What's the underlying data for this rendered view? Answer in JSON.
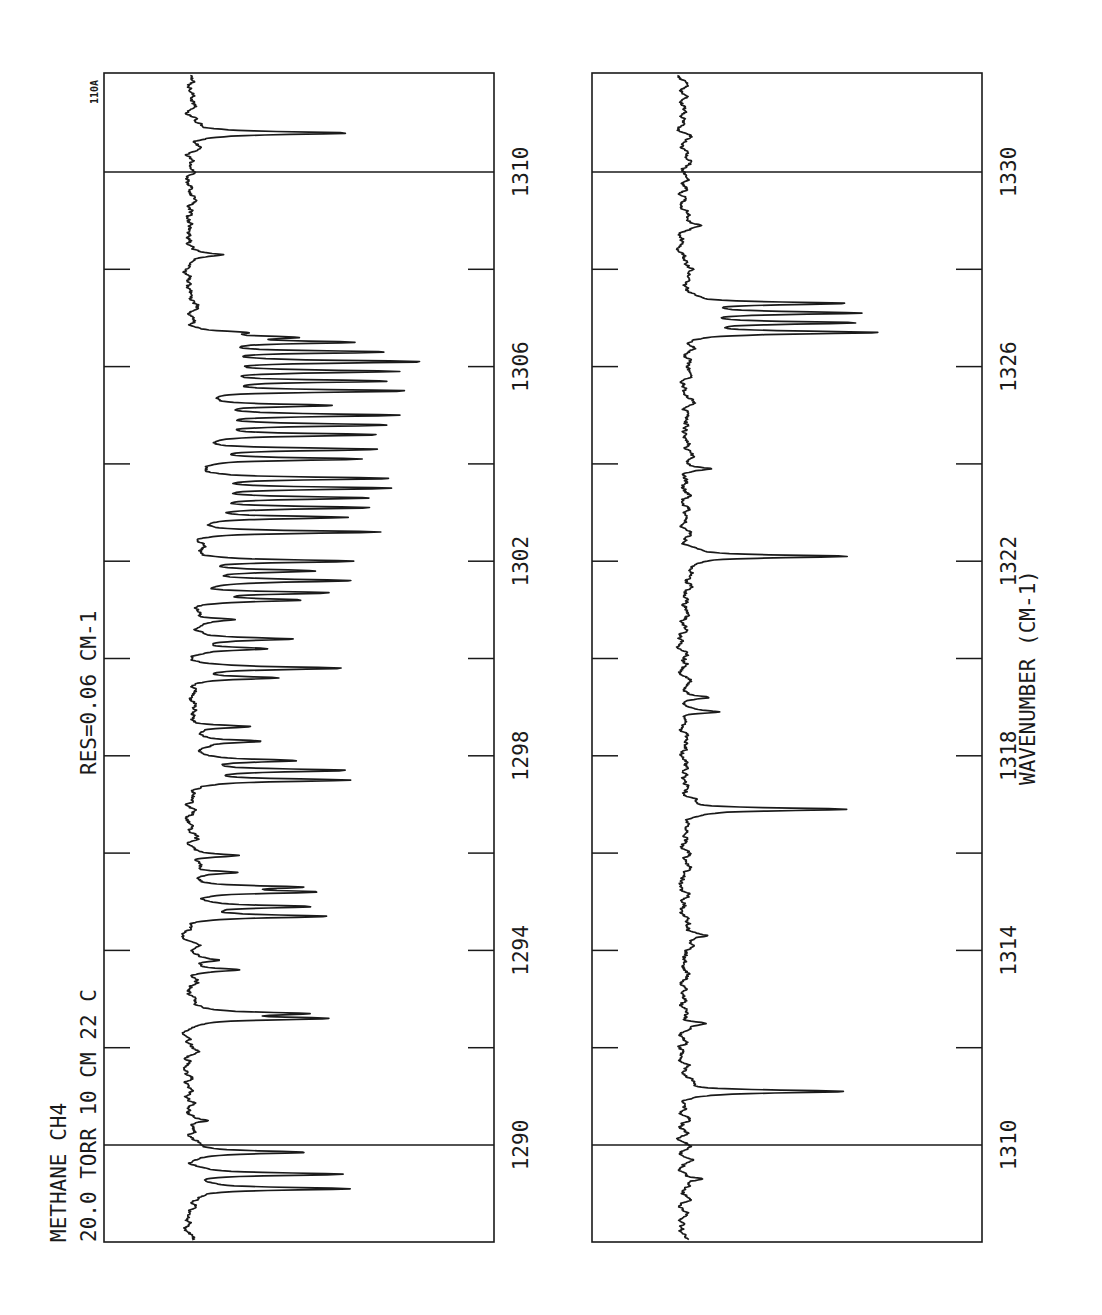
{
  "chart_data": {
    "type": "line",
    "title": "METHANE CH4",
    "sample": {
      "name": "METHANE",
      "formula": "CH4",
      "pressure": "20.0 TORR",
      "path_length": "10 CM",
      "temperature": "22 C",
      "resolution": "RES=0.06 CM-1"
    },
    "plate_id": "110A",
    "xlabel": "WAVENUMBER (CM-1)",
    "ylabel": "",
    "orientation": "rotated 90°: wavenumber increases bottom-to-top; absorption extends rightward from baseline",
    "panels": [
      {
        "id": "left",
        "xlim": [
          1289,
          1311
        ],
        "tick_labels": [
          "1290",
          "1294",
          "1298",
          "1302",
          "1306",
          "1310"
        ],
        "tick_values": [
          1290,
          1292,
          1294,
          1296,
          1298,
          1300,
          1302,
          1304,
          1306,
          1308,
          1310
        ],
        "peaks": [
          {
            "x": 1289.1,
            "depth": 0.55
          },
          {
            "x": 1289.4,
            "depth": 0.55
          },
          {
            "x": 1289.85,
            "depth": 0.4
          },
          {
            "x": 1290.5,
            "depth": 0.08
          },
          {
            "x": 1292.6,
            "depth": 0.47
          },
          {
            "x": 1292.7,
            "depth": 0.38
          },
          {
            "x": 1293.6,
            "depth": 0.15
          },
          {
            "x": 1293.8,
            "depth": 0.1
          },
          {
            "x": 1294.7,
            "depth": 0.46
          },
          {
            "x": 1294.9,
            "depth": 0.4
          },
          {
            "x": 1295.2,
            "depth": 0.4
          },
          {
            "x": 1295.3,
            "depth": 0.38
          },
          {
            "x": 1295.6,
            "depth": 0.17
          },
          {
            "x": 1295.95,
            "depth": 0.17
          },
          {
            "x": 1297.5,
            "depth": 0.55
          },
          {
            "x": 1297.7,
            "depth": 0.5
          },
          {
            "x": 1297.9,
            "depth": 0.36
          },
          {
            "x": 1298.3,
            "depth": 0.23
          },
          {
            "x": 1298.6,
            "depth": 0.2
          },
          {
            "x": 1299.6,
            "depth": 0.32
          },
          {
            "x": 1299.8,
            "depth": 0.52
          },
          {
            "x": 1300.2,
            "depth": 0.26
          },
          {
            "x": 1300.4,
            "depth": 0.33
          },
          {
            "x": 1300.8,
            "depth": 0.15
          },
          {
            "x": 1301.2,
            "depth": 0.36
          },
          {
            "x": 1301.35,
            "depth": 0.47
          },
          {
            "x": 1301.6,
            "depth": 0.55
          },
          {
            "x": 1301.8,
            "depth": 0.4
          },
          {
            "x": 1302.0,
            "depth": 0.55
          },
          {
            "x": 1302.6,
            "depth": 0.66
          },
          {
            "x": 1302.9,
            "depth": 0.52
          },
          {
            "x": 1303.1,
            "depth": 0.6
          },
          {
            "x": 1303.3,
            "depth": 0.6
          },
          {
            "x": 1303.5,
            "depth": 0.66
          },
          {
            "x": 1303.7,
            "depth": 0.68
          },
          {
            "x": 1304.1,
            "depth": 0.56
          },
          {
            "x": 1304.3,
            "depth": 0.63
          },
          {
            "x": 1304.6,
            "depth": 0.62
          },
          {
            "x": 1304.8,
            "depth": 0.63
          },
          {
            "x": 1305.0,
            "depth": 0.68
          },
          {
            "x": 1305.2,
            "depth": 0.46
          },
          {
            "x": 1305.5,
            "depth": 0.73
          },
          {
            "x": 1305.7,
            "depth": 0.65
          },
          {
            "x": 1305.9,
            "depth": 0.66
          },
          {
            "x": 1306.1,
            "depth": 0.77
          },
          {
            "x": 1306.3,
            "depth": 0.66
          },
          {
            "x": 1306.5,
            "depth": 0.51
          },
          {
            "x": 1306.6,
            "depth": 0.3
          },
          {
            "x": 1306.7,
            "depth": 0.14
          },
          {
            "x": 1308.3,
            "depth": 0.1
          },
          {
            "x": 1310.8,
            "depth": 0.54
          }
        ]
      },
      {
        "id": "right",
        "xlim": [
          1309,
          1331
        ],
        "tick_labels": [
          "1310",
          "1314",
          "1318",
          "1322",
          "1326",
          "1330"
        ],
        "tick_values": [
          1310,
          1312,
          1314,
          1316,
          1318,
          1320,
          1322,
          1324,
          1326,
          1328,
          1330
        ],
        "peaks": [
          {
            "x": 1309.3,
            "depth": 0.08
          },
          {
            "x": 1311.1,
            "depth": 0.57
          },
          {
            "x": 1312.5,
            "depth": 0.07
          },
          {
            "x": 1314.3,
            "depth": 0.06
          },
          {
            "x": 1316.9,
            "depth": 0.58
          },
          {
            "x": 1318.9,
            "depth": 0.13
          },
          {
            "x": 1319.2,
            "depth": 0.09
          },
          {
            "x": 1322.1,
            "depth": 0.59
          },
          {
            "x": 1323.9,
            "depth": 0.08
          },
          {
            "x": 1326.7,
            "depth": 0.67
          },
          {
            "x": 1326.9,
            "depth": 0.58
          },
          {
            "x": 1327.1,
            "depth": 0.6
          },
          {
            "x": 1327.3,
            "depth": 0.57
          },
          {
            "x": 1328.9,
            "depth": 0.05
          }
        ]
      }
    ]
  },
  "labels": {
    "line1": "METHANE  CH4",
    "line2": "20.0 TORR  10 CM  22 C",
    "resolution": "RES=0.06 CM-1",
    "plate_id": "110A",
    "xlabel": "WAVENUMBER (CM-1)",
    "left_ticks": [
      "1290",
      "1294",
      "1298",
      "1302",
      "1306",
      "1310"
    ],
    "right_ticks": [
      "1310",
      "1314",
      "1318",
      "1322",
      "1326",
      "1330"
    ]
  },
  "style": {
    "ink": "#1a1a1a",
    "paper": "#ffffff"
  }
}
